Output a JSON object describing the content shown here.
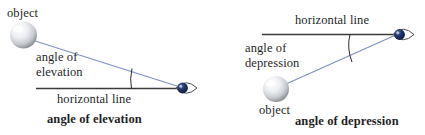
{
  "figure": {
    "background_color": "#ffffff",
    "line_color_sight": "#7d93c0",
    "line_color_horizontal": "#3a3a3a",
    "arc_color": "#2b2b2b",
    "eye_iris_color": "#12254d",
    "sphere_color_light": "#fdfdfd",
    "sphere_color_dark": "#8e9095"
  },
  "diagrams": [
    {
      "id": "angle-of-elevation",
      "caption": "angle of elevation",
      "labels": {
        "object": "object",
        "angle": "angle of\nelevation",
        "horizontal": "horizontal line"
      },
      "icons": {
        "object_icon": "sphere-icon",
        "observer_icon": "eye-icon"
      }
    },
    {
      "id": "angle-of-depression",
      "caption": "angle of depression",
      "labels": {
        "object": "object",
        "angle": "angle of\ndepression",
        "horizontal": "horizontal line"
      },
      "icons": {
        "object_icon": "sphere-icon",
        "observer_icon": "eye-icon"
      }
    }
  ]
}
